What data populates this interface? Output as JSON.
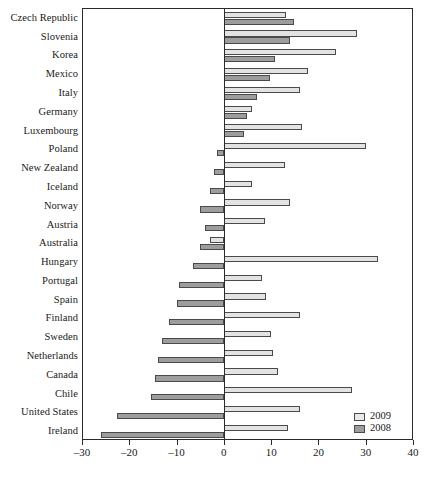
{
  "chart_data": {
    "type": "bar",
    "orientation": "horizontal",
    "title": "",
    "subtitle": "",
    "xlabel": "",
    "ylabel": "",
    "xlim": [
      -30,
      40
    ],
    "xticks": [
      -30,
      -20,
      -10,
      0,
      10,
      20,
      30,
      40
    ],
    "xticklabels": [
      "–30",
      "–20",
      "–10",
      "0",
      "10",
      "20",
      "30",
      "40"
    ],
    "grid": false,
    "legend_position": "bottom-right",
    "zero_reference_line": true,
    "categories": [
      "Czech Republic",
      "Slovenia",
      "Korea",
      "Mexico",
      "Italy",
      "Germany",
      "Luxembourg",
      "Poland",
      "New Zealand",
      "Iceland",
      "Norway",
      "Austria",
      "Australia",
      "Hungary",
      "Portugal",
      "Spain",
      "Finland",
      "Sweden",
      "Netherlands",
      "Canada",
      "Chile",
      "United States",
      "Ireland"
    ],
    "series": [
      {
        "name": "2009",
        "color": "#e3e3e3",
        "values": [
          13.1,
          28.2,
          23.7,
          17.9,
          16.2,
          6.0,
          16.5,
          30.0,
          13.0,
          6.0,
          14.0,
          8.8,
          -3.0,
          32.5,
          8.0,
          9.0,
          16.0,
          10.0,
          10.5,
          11.5,
          27.0,
          16.0,
          13.5
        ]
      },
      {
        "name": "2008",
        "color": "#9d9d9d",
        "values": [
          14.9,
          14.0,
          10.9,
          9.8,
          7.1,
          5.0,
          4.3,
          -1.5,
          -2.0,
          -3.0,
          -5.0,
          -4.0,
          -5.0,
          -6.5,
          -9.5,
          -10.0,
          -11.5,
          -13.0,
          -14.0,
          -14.5,
          -15.5,
          -22.5,
          -26.0
        ]
      }
    ]
  },
  "legend": {
    "items": [
      {
        "label": "2009",
        "swatch": "light-gray-swatch"
      },
      {
        "label": "2008",
        "swatch": "dark-gray-swatch"
      }
    ]
  },
  "caption": {
    "text": ""
  }
}
